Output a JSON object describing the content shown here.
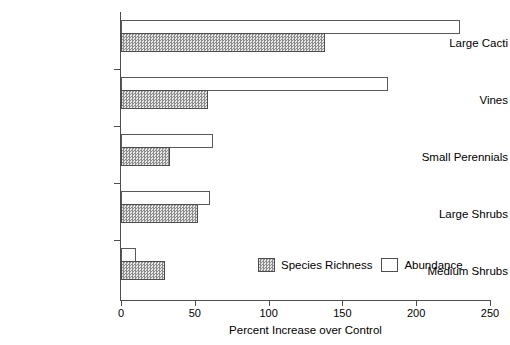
{
  "chart_data": {
    "type": "bar",
    "orientation": "horizontal",
    "title": "",
    "xlabel": "Percent Increase over Control",
    "ylabel": "",
    "xlim": [
      0,
      250
    ],
    "xticks": [
      0,
      50,
      100,
      150,
      200,
      250
    ],
    "xtick_labels": [
      "0",
      "50",
      "100",
      "150",
      "200",
      "250"
    ],
    "grid": false,
    "legend_position": "inside-bottom-right",
    "categories": [
      "Large Cacti",
      "Vines",
      "Small Perennials",
      "Large Shrubs",
      "Medium Shrubs"
    ],
    "series": [
      {
        "name": "Abundance",
        "style": "white-outlined",
        "color": "#ffffff",
        "values": [
          230,
          181,
          62,
          60,
          10
        ]
      },
      {
        "name": "Species Richness",
        "style": "gray-dither-fill",
        "color": "#8c8c8c",
        "values": [
          138,
          59,
          33,
          52,
          30
        ]
      }
    ]
  },
  "legend": {
    "entries": [
      {
        "label": "Species Richness",
        "swatch": "gray-dither"
      },
      {
        "label": "Abundance",
        "swatch": "white"
      }
    ]
  },
  "axis": {
    "x_title": "Percent Increase over Control"
  }
}
